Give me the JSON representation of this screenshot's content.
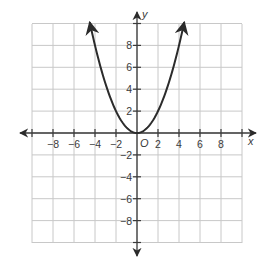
{
  "chart_data": {
    "type": "line",
    "title": "",
    "function": "y = 0.5 * x^2",
    "xlabel": "x",
    "ylabel": "y",
    "origin_label": "O",
    "xlim": [
      -10,
      10
    ],
    "ylim": [
      -10,
      10
    ],
    "grid": true,
    "grid_step": 2,
    "x_ticks": [
      -8,
      -6,
      -4,
      -2,
      2,
      4,
      6,
      8
    ],
    "y_ticks": [
      8,
      6,
      4,
      2,
      -2,
      -4,
      -6,
      -8
    ],
    "x_tick_labels": [
      "−8",
      "−6",
      "−4",
      "−2",
      "2",
      "4",
      "6",
      "8"
    ],
    "y_tick_labels": [
      "8",
      "6",
      "4",
      "2",
      "−2",
      "−4",
      "−6",
      "−8"
    ],
    "series": [
      {
        "name": "parabola",
        "x": [
          -4.5,
          -4,
          -3,
          -2,
          -1,
          0,
          1,
          2,
          3,
          4,
          4.5
        ],
        "y": [
          10.125,
          8,
          4.5,
          2,
          0.5,
          0,
          0.5,
          2,
          4.5,
          8,
          10.125
        ],
        "arrows_at_ends": true
      }
    ],
    "legend": null
  },
  "colors": {
    "grid": "#c8c8c8",
    "axis": "#3a3a3a",
    "curve": "#2b2b2b"
  }
}
